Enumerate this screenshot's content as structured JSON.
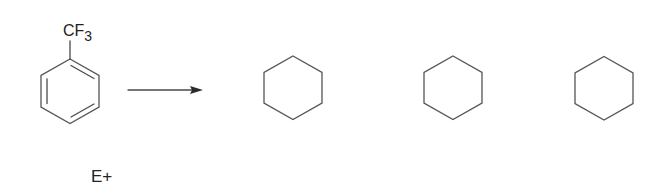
{
  "reactant": {
    "name": "trifluoromethylbenzene",
    "substituent_label": "CF",
    "substituent_subscript": "3"
  },
  "reagent": {
    "label": "E+"
  },
  "arrow": {
    "type": "reaction-arrow"
  },
  "products": [
    {
      "name": "product-ring-1",
      "type": "hexagon"
    },
    {
      "name": "product-ring-2",
      "type": "hexagon"
    },
    {
      "name": "product-ring-3",
      "type": "hexagon"
    }
  ],
  "colors": {
    "line": "#4a4a4a",
    "text": "#222222",
    "background": "#ffffff"
  }
}
